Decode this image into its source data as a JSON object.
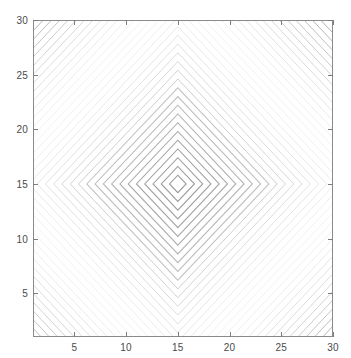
{
  "figure": {
    "background_color": "#ffffff",
    "width": 351,
    "height": 358
  },
  "axes": {
    "box_color": "#8a8a8a",
    "tick_color": "#7d7d7d",
    "tick_label_color": "#4a4a4a",
    "x_ticks": [
      "5",
      "10",
      "15",
      "20",
      "25",
      "30"
    ],
    "y_ticks": [
      "5",
      "10",
      "15",
      "20",
      "25",
      "30"
    ]
  },
  "chart_data": {
    "type": "line",
    "plot_kind": "contour",
    "title": "",
    "subtitle": "",
    "xlabel": "",
    "ylabel": "",
    "xlim": [
      1,
      30
    ],
    "ylim": [
      1,
      30
    ],
    "xticks": [
      5,
      10,
      15,
      20,
      25,
      30
    ],
    "yticks": [
      5,
      10,
      15,
      20,
      25,
      30
    ],
    "xticklabels": [
      "5",
      "10",
      "15",
      "20",
      "25",
      "30"
    ],
    "yticklabels": [
      "5",
      "10",
      "15",
      "20",
      "25",
      "30"
    ],
    "grid": false,
    "legend": null,
    "legend_position": "none",
    "annotations": [],
    "colormap": "gray",
    "line_color": "#808080",
    "center": [
      15,
      15
    ],
    "level_spacing": 0.8,
    "n_levels": 36,
    "series": [
      {
        "name": "contour levels",
        "values": [
          0.8,
          1.6,
          2.4,
          3.2,
          4.0,
          4.8,
          5.6,
          6.4,
          7.2,
          8.0,
          8.8,
          9.6,
          10.4,
          11.2,
          12.0,
          12.8,
          13.6,
          14.4,
          15.2,
          16.0,
          16.8,
          17.6,
          18.4,
          19.2,
          20.0,
          20.8,
          21.6,
          22.4,
          23.2,
          24.0,
          24.8,
          25.6,
          26.4,
          27.2,
          28.0,
          28.8
        ]
      }
    ]
  }
}
